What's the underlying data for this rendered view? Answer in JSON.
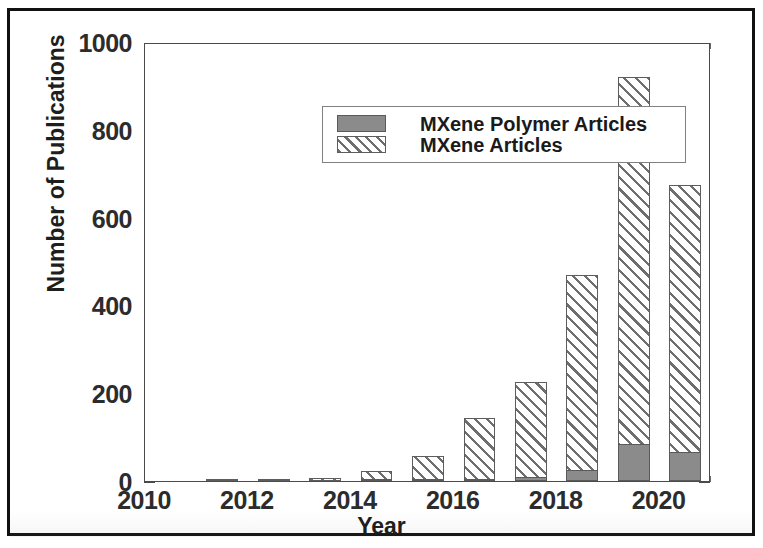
{
  "figure": {
    "border_color": "#111111",
    "background": "#ffffff"
  },
  "axes": {
    "y_title": "Number of Publications",
    "x_title": "Year",
    "y_ticks": [
      "0",
      "200",
      "400",
      "600",
      "800",
      "1000"
    ],
    "x_ticks": [
      "2010",
      "2012",
      "2014",
      "2016",
      "2018",
      "2020"
    ]
  },
  "legend": {
    "entries": [
      {
        "label": "MXene Polymer Articles",
        "swatch": "solid-gray-swatch",
        "color": "#8b8b8b"
      },
      {
        "label": "MXene Articles",
        "swatch": "diagonal-hatch-swatch",
        "color": "#6e6e6e"
      }
    ]
  },
  "chart_data": {
    "type": "bar",
    "title": "",
    "xlabel": "Year",
    "ylabel": "Number of Publications",
    "xlim": [
      2010,
      2021
    ],
    "ylim": [
      0,
      1000
    ],
    "ytick_step": 200,
    "yminor_step": 50,
    "xtick_step": 2,
    "xminor_step": 1,
    "grid": false,
    "legend_position": "upper-left-inside",
    "bar_style": "overlaid",
    "categories": [
      2011,
      2012,
      2013,
      2014,
      2015,
      2016,
      2017,
      2018,
      2019,
      2020
    ],
    "series": [
      {
        "name": "MXene Articles",
        "fill": "diagonal-hatch",
        "color": "#6e6e6e",
        "values": [
          2,
          4,
          8,
          22,
          58,
          143,
          226,
          470,
          920,
          675
        ]
      },
      {
        "name": "MXene Polymer Articles",
        "fill": "solid-gray",
        "color": "#8b8b8b",
        "values": [
          0,
          0,
          0,
          1,
          2,
          4,
          10,
          25,
          85,
          65
        ]
      }
    ]
  }
}
